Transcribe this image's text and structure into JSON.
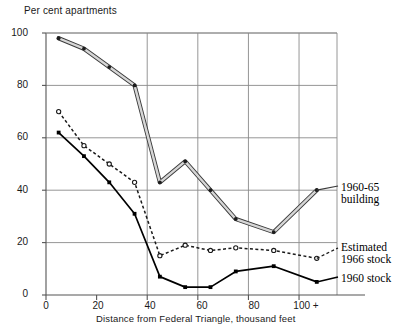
{
  "chart_data": {
    "type": "line",
    "title": "",
    "ylabel": "Per cent apartments",
    "xlabel": "Distance from Federal Triangle,  thousand feet",
    "xlim": [
      0,
      115
    ],
    "ylim": [
      0,
      100
    ],
    "grid": true,
    "legend_position": "right-inline",
    "xticks": [
      {
        "value": 0,
        "label": "0"
      },
      {
        "value": 20,
        "label": "20"
      },
      {
        "value": 40,
        "label": "40"
      },
      {
        "value": 60,
        "label": "60"
      },
      {
        "value": 80,
        "label": "80"
      },
      {
        "value": 100,
        "label": "100 +"
      }
    ],
    "yticks": [
      {
        "value": 0,
        "label": "0"
      },
      {
        "value": 20,
        "label": "20"
      },
      {
        "value": 40,
        "label": "40"
      },
      {
        "value": 60,
        "label": "60"
      },
      {
        "value": 80,
        "label": "80"
      },
      {
        "value": 100,
        "label": "100"
      }
    ],
    "x": [
      5,
      15,
      25,
      35,
      45,
      55,
      65,
      75,
      90,
      107
    ],
    "series": [
      {
        "name": "1960-65 building",
        "label_lines": [
          "1960-65",
          "building"
        ],
        "style": "double-outline-solid",
        "marker": "filled-circle",
        "color": "#2b2b2b",
        "values": [
          98,
          94,
          87,
          80,
          43,
          51,
          40,
          29,
          24,
          40
        ]
      },
      {
        "name": "Estimated 1966 stock",
        "label_lines": [
          "Estimated",
          "1966 stock"
        ],
        "style": "dashed",
        "marker": "open-circle",
        "color": "#1a1a1a",
        "values": [
          70,
          57,
          50,
          43,
          15,
          19,
          17,
          18,
          17,
          14
        ]
      },
      {
        "name": "1960 stock",
        "label_lines": [
          "1960 stock"
        ],
        "style": "solid",
        "marker": "filled-square",
        "color": "#000000",
        "values": [
          62,
          53,
          43,
          31,
          7,
          3,
          3,
          9,
          11,
          5
        ]
      }
    ]
  },
  "labels": {
    "y_axis_title": "Per cent apartments",
    "x_axis_title": "Distance from Federal Triangle,  thousand feet",
    "series1_line1": "1960-65",
    "series1_line2": "building",
    "series2_line1": "Estimated",
    "series2_line2": "1966 stock",
    "series3_line1": "1960 stock"
  },
  "axis": {
    "y_0": "0",
    "y_20": "20",
    "y_40": "40",
    "y_60": "60",
    "y_80": "80",
    "y_100": "100",
    "x_0": "0",
    "x_20": "20",
    "x_40": "40",
    "x_60": "60",
    "x_80": "80",
    "x_100": "100 +"
  },
  "colors": {
    "axis": "#555555",
    "grid": "#8a8a8a",
    "ink": "#111111",
    "background": "#ffffff"
  }
}
